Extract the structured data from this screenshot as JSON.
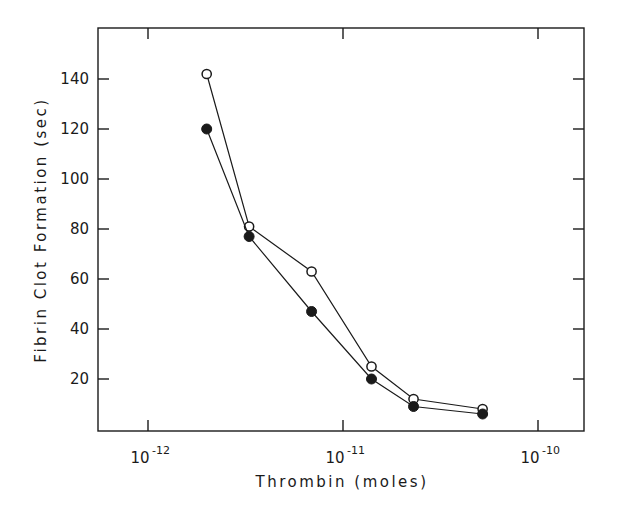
{
  "chart_data": {
    "type": "line",
    "title": "",
    "xlabel": "Thrombin (moles)",
    "ylabel": "Fibrin Clot Formation (sec)",
    "xscale": "log",
    "xlim": [
      5e-13,
      1.8e-10
    ],
    "ylim": [
      0,
      160
    ],
    "x_ticks": [
      {
        "value": 1e-12,
        "label_base": "10",
        "label_exp": "-12"
      },
      {
        "value": 1e-11,
        "label_base": "10",
        "label_exp": "-11"
      },
      {
        "value": 1e-10,
        "label_base": "10",
        "label_exp": "-10"
      }
    ],
    "y_ticks": [
      20,
      40,
      60,
      80,
      100,
      120,
      140
    ],
    "grid": false,
    "legend": null,
    "x": [
      2e-12,
      3.3e-12,
      6.9e-12,
      1.4e-11,
      2.3e-11,
      5.2e-11
    ],
    "series": [
      {
        "name": "open circles",
        "marker": "open-circle",
        "values": [
          142,
          81,
          63,
          25,
          12,
          8
        ]
      },
      {
        "name": "filled circles",
        "marker": "filled-circle",
        "values": [
          120,
          77,
          47,
          20,
          9,
          6
        ]
      }
    ]
  },
  "colors": {
    "ink": "#1a1a1a",
    "background": "#ffffff"
  }
}
